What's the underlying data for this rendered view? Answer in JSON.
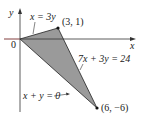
{
  "diagram": {
    "type": "region-plot",
    "axes": {
      "x_label": "x",
      "y_label": "y",
      "origin_label": "0"
    },
    "region": {
      "vertices": [
        [
          0,
          0
        ],
        [
          3,
          1
        ],
        [
          6,
          -6
        ]
      ],
      "fill": "#9a9a9a",
      "edge_color": "#222222"
    },
    "lines": [
      {
        "equation": "x = 3y",
        "from": [
          0,
          0
        ],
        "to": [
          3,
          1
        ]
      },
      {
        "equation": "7x + 3y = 24",
        "from": [
          3,
          1
        ],
        "to": [
          6,
          -6
        ]
      },
      {
        "equation": "x + y = 0",
        "from": [
          0,
          0
        ],
        "to": [
          6,
          -6
        ]
      }
    ],
    "points": [
      {
        "label": "(3, 1)",
        "coords": [
          3,
          1
        ]
      },
      {
        "label": "(6, −6)",
        "coords": [
          6,
          -6
        ]
      }
    ]
  },
  "labels": {
    "y_axis": "y",
    "x_axis": "x",
    "origin": "0",
    "line_top": "x = 3y",
    "line_right": "7x + 3y = 24",
    "line_bottom": "x + y = 0",
    "point_top": "(3, 1)",
    "point_bottom": "(6, −6)"
  }
}
